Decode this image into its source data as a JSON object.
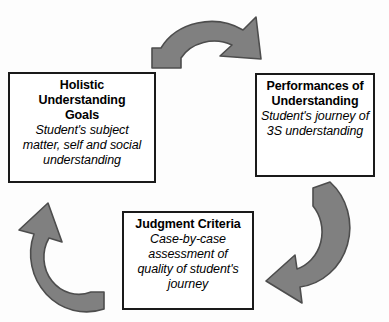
{
  "diagram": {
    "type": "cyclical-process",
    "background_color": "#fdfdfd",
    "arrow_fill_color": "#808080",
    "arrow_stroke_color": "#4d4d4d",
    "box_border_color": "#1a1a1a",
    "box_fill_color": "#ffffff",
    "text_color": "#000000",
    "nodes": [
      {
        "id": "goals",
        "title": "Holistic\nUnderstanding\nGoals",
        "title_lines": [
          "Holistic",
          "Understanding",
          "Goals"
        ],
        "description": "Student's subject matter, self and social understanding",
        "description_lines": [
          "Student's subject",
          "matter, self and social",
          "understanding"
        ],
        "position": "left"
      },
      {
        "id": "performances",
        "title": "Performances of\nUnderstanding",
        "title_lines": [
          "Performances of",
          "Understanding"
        ],
        "description": "Student's journey of 3S understanding",
        "description_lines": [
          "Student's journey of",
          "3S understanding"
        ],
        "position": "right"
      },
      {
        "id": "judgment",
        "title": "Judgment Criteria",
        "title_lines": [
          "Judgment Criteria"
        ],
        "description": "Case-by-case assessment of quality of student's journey",
        "description_lines": [
          "Case-by-case",
          "assessment of",
          "quality of student's",
          "journey"
        ],
        "position": "bottom"
      }
    ],
    "arrows": [
      {
        "id": "arrow-top",
        "from": "goals",
        "to": "performances",
        "direction": "clockwise-top",
        "icon": "curved-arrow-icon"
      },
      {
        "id": "arrow-right",
        "from": "performances",
        "to": "judgment",
        "direction": "clockwise-right",
        "icon": "curved-arrow-icon"
      },
      {
        "id": "arrow-left",
        "from": "judgment",
        "to": "goals",
        "direction": "clockwise-left",
        "icon": "curved-arrow-icon"
      }
    ]
  }
}
